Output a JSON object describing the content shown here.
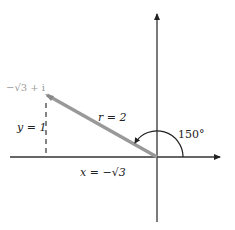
{
  "diagram": {
    "point_label": "−√3 + i",
    "radius_label": "r = 2",
    "y_label": "y = 1",
    "x_label": "x = −√3",
    "angle_label": "150°",
    "colors": {
      "axis": "#333333",
      "vector": "#999999",
      "dashed": "#333333",
      "arc": "#222222",
      "point_label": "#999999"
    },
    "geometry": {
      "origin": [
        157,
        157
      ],
      "point": [
        47,
        95
      ],
      "angle_degrees": 150,
      "radius": 2,
      "x_component": "-√3",
      "y_component": "1"
    }
  }
}
